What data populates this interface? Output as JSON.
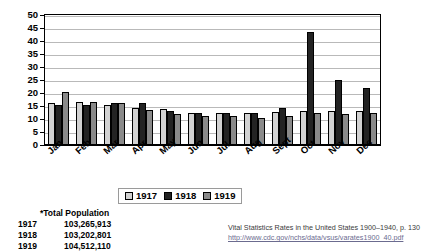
{
  "chart_data": {
    "type": "bar",
    "title": "",
    "xlabel": "",
    "ylabel": "",
    "ylim": [
      0,
      50
    ],
    "yticks": [
      0,
      5,
      10,
      15,
      20,
      25,
      30,
      35,
      40,
      45,
      50
    ],
    "grid": true,
    "legend_position": "bottom-center",
    "categories": [
      "Jan",
      "Feb",
      "Mar",
      "Apr",
      "May",
      "Jun",
      "Jul",
      "Aug",
      "Sept",
      "Oct",
      "Nov",
      "Dec"
    ],
    "series": [
      {
        "name": "1917",
        "color": "#d2d2d2",
        "values": [
          16.3,
          16.5,
          15.2,
          14.3,
          14.0,
          12.5,
          12.5,
          12.5,
          12.8,
          13.0,
          13.0,
          13.0
        ]
      },
      {
        "name": "1918",
        "color": "#232323",
        "values": [
          15.3,
          15.2,
          16.0,
          16.3,
          13.0,
          12.5,
          12.5,
          12.5,
          14.2,
          43.5,
          25.0,
          22.0
        ]
      },
      {
        "name": "1919",
        "color": "#8a8a8a",
        "values": [
          20.3,
          16.5,
          16.0,
          13.5,
          12.0,
          11.0,
          11.0,
          10.5,
          11.0,
          12.5,
          12.0,
          12.5
        ]
      }
    ]
  },
  "legend": {
    "items": [
      {
        "label": "1917"
      },
      {
        "label": "1918"
      },
      {
        "label": "1919"
      }
    ]
  },
  "population_note": {
    "title": "*Total Population",
    "rows": [
      {
        "year": "1917",
        "value": "103,265,913"
      },
      {
        "year": "1918",
        "value": "103,202,801"
      },
      {
        "year": "1919",
        "value": "104,512,110"
      }
    ]
  },
  "source": {
    "citation": "Vital Statistics Rates in the United States 1900–1940, p. 130",
    "url": "http://www.cdc.gov/nchs/data/vsus/varates1900_40.pdf"
  }
}
